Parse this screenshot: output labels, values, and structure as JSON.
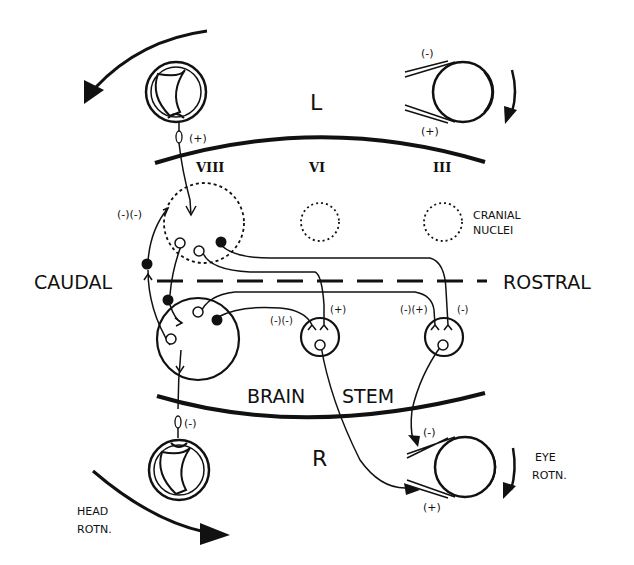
{
  "diagram": {
    "side_labels": {
      "left_side": "L",
      "right_side": "R"
    },
    "direction_labels": {
      "caudal": "CAUDAL",
      "rostral": "ROSTRAL"
    },
    "region_label": {
      "brain": "BRAIN",
      "stem": "STEM"
    },
    "cranial_nuclei_label": {
      "line1": "CRANIAL",
      "line2": "NUCLEI"
    },
    "nerve_numerals": {
      "viii": "VIII",
      "vi": "VI",
      "iii": "III"
    },
    "head_rotation_label": {
      "line1": "HEAD",
      "line2": "ROTN."
    },
    "eye_rotation_label": {
      "line1": "EYE",
      "line2": "ROTN."
    },
    "signs": {
      "left_canal": "(+)",
      "right_canal": "(-)",
      "left_eye_top": "(-)",
      "left_eye_bottom": "(+)",
      "right_eye_top": "(-)",
      "right_eye_bottom": "(+)",
      "vestibular_input": "(-)(-)",
      "vi_nucleus_left": "(-)(-)",
      "vi_nucleus_right": "(+)",
      "iii_nucleus_left": "(-)(+)",
      "iii_nucleus_right": "(-)"
    }
  }
}
